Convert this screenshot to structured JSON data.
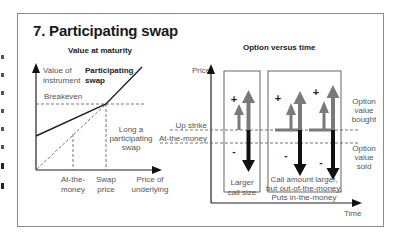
{
  "title": "7. Participating swap",
  "left_panel": {
    "heading": "Value at maturity",
    "y_axis_label_1": "Value of",
    "y_axis_label_2": "instrument",
    "series_label_1": "Participating",
    "series_label_2": "swap",
    "breakeven_label": "Breakeven",
    "annotation_1": "Long a",
    "annotation_2": "participating",
    "annotation_3": "swap",
    "x_ticks": [
      {
        "line1": "At-the-",
        "line2": "money"
      },
      {
        "line1": "Swap",
        "line2": "price"
      }
    ],
    "x_axis_label_1": "Price of",
    "x_axis_label_2": "underlying"
  },
  "right_panel": {
    "heading": "Option versus time",
    "y_axis_label": "Price",
    "x_axis_label": "Time",
    "level_up_strike": "Up strike",
    "level_atm": "At-the-money",
    "legend_bought_1": "Option",
    "legend_bought_2": "value",
    "legend_bought_3": "bought",
    "legend_sold_1": "Option",
    "legend_sold_2": "value",
    "legend_sold_3": "sold",
    "box1_caption_1": "Larger",
    "box1_caption_2": "call size",
    "box2_caption_1": "Call amount larger,",
    "box2_caption_2": "but out-of-the-money,",
    "box2_caption_3": "Puts in-the-money",
    "plus_sign": "+",
    "minus_sign": "-"
  },
  "colors": {
    "bought_arrow": "#7a7a7a",
    "sold_arrow": "#111111",
    "line": "#222222",
    "dashed": "#666666"
  }
}
